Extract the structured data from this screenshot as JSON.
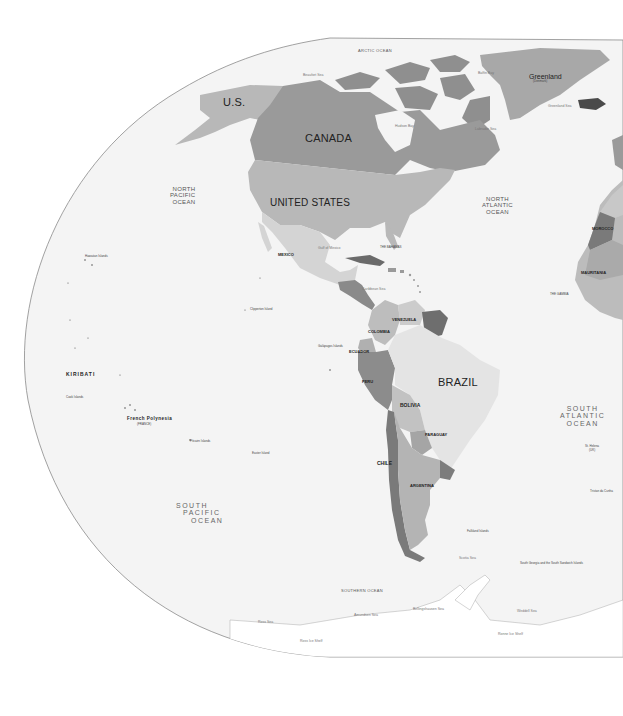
{
  "map": {
    "projection_frame": "elliptical",
    "colors": {
      "ocean": "#f4f4f4",
      "frame_line": "#8a8a8a",
      "background": "#ffffff",
      "canada": "#9a9a9a",
      "united_states": "#b8b8b8",
      "alaska": "#b8b8b8",
      "greenland": "#a8a8a8",
      "mexico": "#d4d4d4",
      "brazil": "#e4e4e4",
      "argentina": "#b4b4b4",
      "chile": "#7a7a7a",
      "peru": "#8c8c8c",
      "bolivia": "#c2c2c2",
      "colombia": "#bdbdbd",
      "venezuela": "#cccccc",
      "guyana": "#6e6e6e",
      "paraguay": "#a5a5a5",
      "uruguay": "#7c7c7c",
      "ecuador": "#b0b0b0",
      "central_america": "#8a8a8a",
      "cuba": "#6a6a6a",
      "arctic_islands": "#8f8f8f",
      "iceland": "#4a4a4a",
      "africa_west": "#bcbcbc",
      "morocco": "#c8c8c8",
      "mauritania": "#aaaaaa",
      "western_sahara": "#7a7a7a",
      "antarctica": "#ffffff"
    },
    "countries": {
      "us_alaska": "U.S.",
      "canada": "CANADA",
      "united_states": "UNITED STATES",
      "greenland": "Greenland",
      "greenland_sub": "(Denmark)",
      "mexico": "MEXICO",
      "brazil": "BRAZIL",
      "colombia": "COLOMBIA",
      "venezuela": "VENEZUELA",
      "ecuador": "ECUADOR",
      "peru": "PERU",
      "bolivia": "BOLIVIA",
      "paraguay": "PARAGUAY",
      "chile": "CHILE",
      "argentina": "ARGENTINA",
      "kiribati": "KIRIBATI",
      "french_polynesia": "French Polynesia",
      "french_polynesia_sub": "(FRANCE)",
      "morocco": "MOROCCO",
      "mauritania": "MAURITANIA",
      "the_gambia": "THE GAMBIA",
      "the_bahamas": "THE BAHAMAS"
    },
    "oceans": {
      "arctic": "ARCTIC OCEAN",
      "north_pacific": [
        "NORTH",
        "PACIFIC",
        "OCEAN"
      ],
      "north_atlantic": [
        "NORTH",
        "ATLANTIC",
        "OCEAN"
      ],
      "south_pacific": [
        "SOUTH",
        "PACIFIC",
        "OCEAN"
      ],
      "south_atlantic": [
        "SOUTH",
        "ATLANTIC",
        "OCEAN"
      ],
      "southern": "SOUTHERN OCEAN"
    },
    "seas": {
      "beaufort": "Beaufort Sea",
      "baffin_bay": "Baffin Bay",
      "hudson_bay": "Hudson Bay",
      "labrador_sea": "Labrador Sea",
      "greenland_sea": "Greenland Sea",
      "gulf_of_mexico": "Gulf of Mexico",
      "caribbean_sea": "Caribbean Sea",
      "scotia_sea": "Scotia Sea",
      "weddell_sea": "Weddell Sea",
      "ross_sea": "Ross Sea",
      "amundsen_sea": "Amundsen Sea",
      "bellingshausen_sea": "Bellingshausen Sea",
      "ronne_ice_shelf": "Ronne Ice Shelf",
      "ross_ice_shelf": "Ross Ice Shelf"
    },
    "territories": {
      "st_helena": "St. Helena",
      "st_helena_sub": "(UK)",
      "falkland": "Falkland Islands",
      "south_georgia": "South Georgia and the South Sandwich Islands",
      "galapagos": "Galápagos Islands",
      "clipperton": "Clipperton Island",
      "pitcairn": "Pitcairn Islands",
      "easter_island": "Easter Island",
      "cook_islands": "Cook Islands",
      "hawaiian_islands": "Hawaiian Islands",
      "tristan": "Tristan da Cunha"
    }
  }
}
